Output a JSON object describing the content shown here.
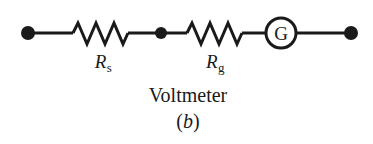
{
  "figure": {
    "type": "circuit-diagram",
    "title_text": "Voltmeter",
    "caption_open_paren": "(",
    "caption_letter": "b",
    "caption_close_paren": ")",
    "background_color": "#ffffff",
    "ink_color": "#1a1a1a",
    "width": 373,
    "height": 144
  },
  "circuit": {
    "description": "Voltmeter: series resistor Rs in series with galvanometer internal resistance Rg and galvanometer G",
    "baseline_y": 33,
    "wire_color": "#1a1a1a",
    "wire_width": 3,
    "terminals": [
      {
        "name": "left-terminal",
        "x": 28,
        "y": 33,
        "radius": 7
      },
      {
        "name": "right-terminal",
        "x": 351,
        "y": 33,
        "radius": 7
      }
    ],
    "junctions": [
      {
        "name": "middle-junction",
        "x": 160,
        "y": 33,
        "radius": 6
      }
    ],
    "resistors": [
      {
        "name": "series-resistor",
        "label_r": "R",
        "label_sub": "s",
        "label_full": "Rs",
        "x_start": 72,
        "x_end": 130,
        "peak_top_y": 22,
        "peak_bottom_y": 44,
        "label_center_x": 103,
        "label_top_y": 52
      },
      {
        "name": "galvanometer-resistance",
        "label_r": "R",
        "label_sub": "g",
        "label_full": "Rg",
        "x_start": 186,
        "x_end": 243,
        "peak_top_y": 22,
        "peak_bottom_y": 44,
        "label_center_x": 215,
        "label_top_y": 52
      }
    ],
    "galvanometer": {
      "name": "galvanometer",
      "symbol": "G",
      "center_x": 281,
      "center_y": 33,
      "radius": 15,
      "stroke_width": 3,
      "font_size": 19
    }
  },
  "text_blocks": {
    "device_label": {
      "text": "Voltmeter",
      "center_x": 188,
      "top_y": 85,
      "font_size": 20
    },
    "caption": {
      "text": "(b)",
      "center_x": 188,
      "top_y": 111,
      "font_size": 20
    }
  }
}
